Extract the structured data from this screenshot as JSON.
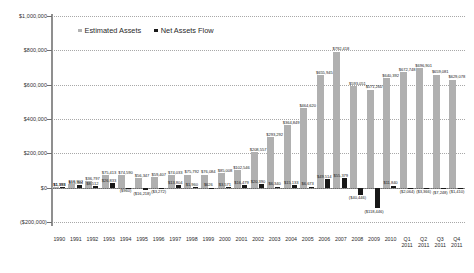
{
  "chart_data": {
    "type": "bar",
    "title": "",
    "xlabel": "",
    "ylabel": "Assets ($MM)",
    "ylim": [
      -200000,
      1000000
    ],
    "ytick_labels": [
      "$1,000,000",
      "$800,000",
      "$600,000",
      "$400,000",
      "$200,000",
      "$0",
      "($200,000)"
    ],
    "ytick_values": [
      1000000,
      800000,
      600000,
      400000,
      200000,
      0,
      -200000
    ],
    "grid": true,
    "legend_position": "top-left",
    "categories": [
      "1990",
      "1991",
      "1992",
      "1993",
      "1994",
      "1995",
      "1996",
      "1997",
      "1998",
      "1999",
      "2000",
      "2001",
      "2002",
      "2003",
      "2004",
      "2005",
      "2006",
      "2007",
      "2008",
      "2009",
      "2010",
      "Q1 2011",
      "Q2 2011",
      "Q3 2011",
      "Q4 2011"
    ],
    "category_lines": [
      [
        "1990",
        ""
      ],
      [
        "1991",
        ""
      ],
      [
        "1992",
        ""
      ],
      [
        "1993",
        ""
      ],
      [
        "1994",
        ""
      ],
      [
        "1995",
        ""
      ],
      [
        "1996",
        ""
      ],
      [
        "1997",
        ""
      ],
      [
        "1998",
        ""
      ],
      [
        "1999",
        ""
      ],
      [
        "2000",
        ""
      ],
      [
        "2001",
        ""
      ],
      [
        "2002",
        ""
      ],
      [
        "2003",
        ""
      ],
      [
        "2004",
        ""
      ],
      [
        "2005",
        ""
      ],
      [
        "2006",
        ""
      ],
      [
        "2007",
        ""
      ],
      [
        "2008",
        ""
      ],
      [
        "2009",
        ""
      ],
      [
        "2010",
        ""
      ],
      [
        "Q1",
        "2011"
      ],
      [
        "Q2",
        "2011"
      ],
      [
        "Q3",
        "2011"
      ],
      [
        "Q4",
        "2011"
      ]
    ],
    "series": [
      {
        "name": "Estimated Assets",
        "color": "#b0b0b0",
        "values": [
          1393,
          19902,
          36797,
          75413,
          74590,
          56347,
          59407,
          74033,
          75792,
          76084,
          85008,
          102546,
          208557,
          293292,
          364849,
          464620,
          655945,
          792418,
          593051,
          571260,
          640392,
          672748,
          696901,
          659081,
          629078
        ],
        "labels": [
          "$1,393",
          "$19,902",
          "$36,797",
          "$75,413",
          "$74,590",
          "$56,347",
          "$59,407",
          "$74,033",
          "$75,792",
          "$76,084",
          "$85,008",
          "$102,546",
          "$208,557",
          "$293,292",
          "$364,849",
          "$464,620",
          "$655,945",
          "$792,418",
          "$593,051",
          "$571,260",
          "$640,392",
          "$672,748",
          "$696,901",
          "$659,081",
          "$629,078"
        ]
      },
      {
        "name": "Net Assets Flow",
        "color": "#181818",
        "values": [
          1393,
          15344,
          8512,
          26833,
          -960,
          -16218,
          -3272,
          13804,
          1960,
          626,
          3571,
          16479,
          20390,
          6340,
          15133,
          6673,
          49514,
          55379,
          -40446,
          -118446,
          11840,
          -2064,
          -3366,
          -7248,
          -1410
        ],
        "labels": [
          "$1,393",
          "$15,344",
          "$8,512",
          "$26,833",
          "($960)",
          "($16,218)",
          "($3,272)",
          "$13,804",
          "$1,960",
          "$626",
          "$3,571",
          "$16,479",
          "$20,390",
          "$6,340",
          "$15,133",
          "$6,673",
          "$49,514",
          "$55,379",
          "($40,446)",
          "($118,446)",
          "$11,840",
          "($2,064)",
          "($3,366)",
          "($7,248)",
          "($1,410)"
        ]
      }
    ]
  },
  "legend": {
    "estimated_assets": "Estimated Assets",
    "net_assets_flow": "Net Assets Flow"
  }
}
